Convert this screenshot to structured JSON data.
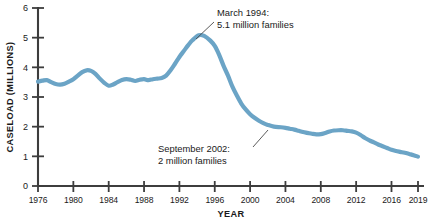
{
  "chart_data": {
    "type": "line",
    "title": "",
    "xlabel": "YEAR",
    "ylabel": "CASELOAD (MILLIONS)",
    "xlim": [
      1976,
      2019
    ],
    "ylim": [
      0,
      6
    ],
    "grid": false,
    "legend": "none",
    "line_color": "#6ba4c6",
    "xticks": [
      1976,
      1980,
      1984,
      1988,
      1992,
      1996,
      2000,
      2004,
      2008,
      2012,
      2016,
      2019
    ],
    "xtick_labels": [
      "1976",
      "1980",
      "1984",
      "1988",
      "1992",
      "1996",
      "2000",
      "2004",
      "2008",
      "2012",
      "2016",
      "2019"
    ],
    "yticks": [
      0,
      1,
      2,
      3,
      4,
      5,
      6
    ],
    "ytick_labels": [
      "0",
      "1",
      "2",
      "3",
      "4",
      "5",
      "6"
    ],
    "series": [
      {
        "name": "AFDC/TANF caseload",
        "x": [
          1976,
          1976.5,
          1977,
          1977.5,
          1978,
          1978.5,
          1979,
          1979.5,
          1980,
          1980.5,
          1981,
          1981.5,
          1982,
          1982.5,
          1983,
          1983.5,
          1984,
          1984.5,
          1985,
          1985.5,
          1986,
          1986.5,
          1987,
          1987.5,
          1988,
          1988.5,
          1989,
          1989.5,
          1990,
          1990.5,
          1991,
          1991.5,
          1992,
          1992.5,
          1993,
          1993.5,
          1994.2,
          1994.8,
          1995.5,
          1996,
          1996.5,
          1997,
          1997.5,
          1998,
          1998.5,
          1999,
          1999.5,
          2000,
          2000.5,
          2001,
          2001.5,
          2002,
          2002.7,
          2003.5,
          2004,
          2004.5,
          2005,
          2005.5,
          2006,
          2006.5,
          2007,
          2007.5,
          2008,
          2008.5,
          2009,
          2009.5,
          2010,
          2010.5,
          2011,
          2011.5,
          2012,
          2012.5,
          2013,
          2013.5,
          2014,
          2014.5,
          2015,
          2015.5,
          2016,
          2016.5,
          2017,
          2017.5,
          2018,
          2018.5,
          2019
        ],
        "values": [
          3.52,
          3.55,
          3.57,
          3.5,
          3.44,
          3.42,
          3.45,
          3.52,
          3.6,
          3.72,
          3.84,
          3.9,
          3.88,
          3.78,
          3.62,
          3.48,
          3.38,
          3.42,
          3.5,
          3.57,
          3.6,
          3.58,
          3.54,
          3.58,
          3.6,
          3.57,
          3.6,
          3.62,
          3.64,
          3.72,
          3.9,
          4.12,
          4.35,
          4.55,
          4.75,
          4.92,
          5.08,
          5.06,
          4.9,
          4.72,
          4.42,
          4.05,
          3.72,
          3.35,
          3.05,
          2.78,
          2.58,
          2.42,
          2.3,
          2.2,
          2.12,
          2.06,
          2.0,
          1.98,
          1.96,
          1.93,
          1.9,
          1.86,
          1.82,
          1.79,
          1.76,
          1.74,
          1.75,
          1.79,
          1.84,
          1.87,
          1.88,
          1.88,
          1.86,
          1.84,
          1.8,
          1.72,
          1.62,
          1.54,
          1.47,
          1.4,
          1.34,
          1.28,
          1.22,
          1.18,
          1.15,
          1.12,
          1.08,
          1.04,
          0.99
        ]
      }
    ],
    "annotations": [
      {
        "id": "peak-1994",
        "line1": "March 1994:",
        "line2": "5.1 million families",
        "point_x": 1994.2,
        "point_y": 5.08
      },
      {
        "id": "sept-2002",
        "line1": "September 2002:",
        "line2": "2 million families",
        "point_x": 2002.7,
        "point_y": 2.0
      }
    ]
  }
}
